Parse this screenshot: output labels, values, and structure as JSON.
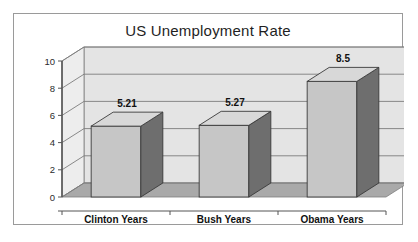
{
  "chart_data": {
    "type": "bar",
    "title": "US Unemployment Rate",
    "categories": [
      "Clinton Years",
      "Bush Years",
      "Obama Years"
    ],
    "values": [
      5.21,
      5.27,
      8.5
    ],
    "value_labels": [
      "5.21",
      "5.27",
      "8.5"
    ],
    "xlabel": "",
    "ylabel": "",
    "ylim": [
      0,
      10
    ],
    "ytick_labels": [
      "0",
      "2",
      "4",
      "6",
      "8",
      "10"
    ],
    "ytick_values": [
      0,
      2,
      4,
      6,
      8,
      10
    ],
    "grid": true,
    "legend": false,
    "style": "3d-column",
    "colors": {
      "bar_front": "#c6c6c6",
      "bar_side": "#6e6e6e",
      "bar_top": "#d8d8d8",
      "wall_back": "#e4e4e4",
      "wall_side": "#ededed",
      "floor": "#a9a9a9",
      "gridline": "#7d7d7d",
      "axis": "#555555",
      "frame": "#9a9a9a",
      "text": "#1f1f1f"
    }
  }
}
